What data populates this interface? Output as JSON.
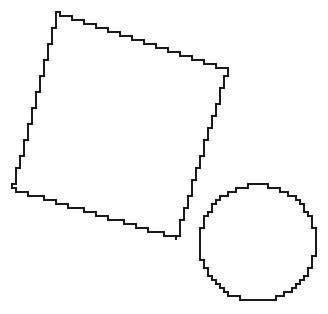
{
  "figure": {
    "background_color": "#ffffff",
    "stroke_color": "#1a1a1a",
    "stroke_width": 1.6,
    "width": 328,
    "height": 314,
    "render_style": "aliased-staircase-outline"
  },
  "chart_data": {
    "type": "scatter",
    "xlabel": "",
    "ylabel": "",
    "xlim": [
      0,
      328
    ],
    "ylim": [
      0,
      314
    ],
    "grid": false,
    "legend": "none",
    "shapes": [
      {
        "name": "rotated-square",
        "kind": "quadrilateral",
        "rotation_deg": 18.5,
        "side_length_px": 179,
        "center": [
          119,
          125
        ],
        "vertices": [
          [
            58,
            13
          ],
          [
            228,
            70
          ],
          [
            177,
            238
          ],
          [
            13,
            189
          ]
        ]
      },
      {
        "name": "circle",
        "kind": "circle",
        "center": [
          258,
          243
        ],
        "radius_px": 58,
        "bbox": [
          200,
          185,
          317,
          303
        ]
      }
    ]
  },
  "shapes": {
    "square": {
      "label": "rotated-square",
      "step_size": 4,
      "vertices": [
        [
          58,
          13
        ],
        [
          228,
          70
        ],
        [
          177,
          238
        ],
        [
          13,
          189
        ]
      ]
    },
    "circle": {
      "label": "circle",
      "step_size": 4,
      "cx": 258,
      "cy": 243,
      "r": 58
    }
  }
}
